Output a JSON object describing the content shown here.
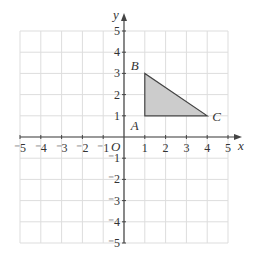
{
  "diagram": {
    "type": "coordinate-grid",
    "x_axis": {
      "label": "x",
      "min": -5,
      "max": 5,
      "ticks": [
        "-5",
        "-4",
        "-3",
        "-2",
        "-1",
        "1",
        "2",
        "3",
        "4",
        "5"
      ]
    },
    "y_axis": {
      "label": "y",
      "min": -5,
      "max": 5,
      "ticks": [
        "5",
        "4",
        "3",
        "2",
        "1",
        "-1",
        "-2",
        "-3",
        "-4",
        "-5"
      ]
    },
    "origin_label": "O",
    "shape": {
      "name": "triangle ABC",
      "fill": "#cccccc",
      "stroke": "#444444",
      "vertices": [
        {
          "label": "A",
          "x": 1,
          "y": 1
        },
        {
          "label": "B",
          "x": 1,
          "y": 3
        },
        {
          "label": "C",
          "x": 4,
          "y": 1
        }
      ]
    },
    "colors": {
      "grid": "#dddddd",
      "axis": "#444444",
      "text": "#333333"
    }
  }
}
